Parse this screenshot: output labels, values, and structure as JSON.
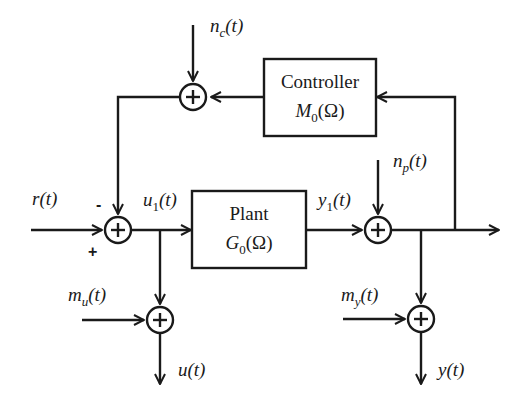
{
  "diagram": {
    "type": "block-diagram",
    "title": "",
    "stroke_color": "#1a1a1a",
    "background": "#ffffff",
    "blocks": [
      {
        "id": "controller",
        "name": "Controller",
        "transfer": "M",
        "transfer_sub": "0",
        "arg": "(Ω)"
      },
      {
        "id": "plant",
        "name": "Plant",
        "transfer": "G",
        "transfer_sub": "0",
        "arg": "(Ω)"
      }
    ],
    "summing_junctions": [
      "sum-reference",
      "sum-controller-noise",
      "sum-process-noise",
      "sum-input-measurement",
      "sum-output-measurement"
    ],
    "signals": {
      "r": {
        "base": "r",
        "sub": "",
        "arg": "(t)"
      },
      "nc": {
        "base": "n",
        "sub": "c",
        "arg": "(t)"
      },
      "np": {
        "base": "n",
        "sub": "p",
        "arg": "(t)"
      },
      "u1": {
        "base": "u",
        "sub": "1",
        "arg": "(t)"
      },
      "y1": {
        "base": "y",
        "sub": "1",
        "arg": "(t)"
      },
      "mu": {
        "base": "m",
        "sub": "u",
        "arg": "(t)"
      },
      "my": {
        "base": "m",
        "sub": "y",
        "arg": "(t)"
      },
      "u": {
        "base": "u",
        "sub": "",
        "arg": "(t)"
      },
      "y": {
        "base": "y",
        "sub": "",
        "arg": "(t)"
      }
    },
    "signs": {
      "minus": "-",
      "plus": "+"
    }
  }
}
